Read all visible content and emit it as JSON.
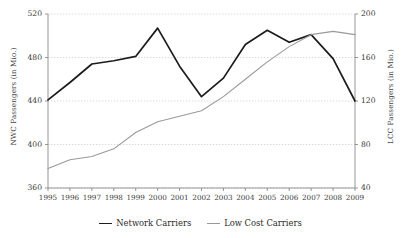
{
  "chart_data": {
    "type": "line",
    "title": "",
    "xlabel": "",
    "categories": [
      "1995",
      "1996",
      "1997",
      "1998",
      "1999",
      "2000",
      "2001",
      "2002",
      "2003",
      "2004",
      "2005",
      "2006",
      "2007",
      "2008",
      "2009"
    ],
    "grid": true,
    "legend_position": "bottom",
    "axes": {
      "left": {
        "label": "NWC Passengers (in Mio.)",
        "ticks": [
          "520",
          "480",
          "440",
          "400",
          "360"
        ],
        "tick_values": [
          520,
          480,
          440,
          400,
          360
        ],
        "range": [
          360,
          520
        ]
      },
      "right": {
        "label": "LCC Passengers (in Mio.)",
        "ticks": [
          "200",
          "160",
          "120",
          "80",
          "40"
        ],
        "tick_values": [
          200,
          160,
          120,
          80,
          40
        ],
        "range": [
          40,
          200
        ]
      }
    },
    "series": [
      {
        "name": "Network Carriers",
        "axis": "left",
        "color": "#1c1c1c",
        "width": 1.7,
        "values": [
          441,
          457,
          474,
          477,
          481,
          507,
          472,
          444,
          461,
          492,
          505,
          494,
          501,
          479,
          440
        ]
      },
      {
        "name": "Low Cost Carriers",
        "axis": "right",
        "color": "#9a9a9a",
        "width": 1.1,
        "values": [
          58,
          66,
          69,
          76,
          91,
          101,
          106,
          111,
          124,
          140,
          156,
          170,
          181,
          184,
          181
        ]
      }
    ]
  },
  "legend": {
    "items": [
      {
        "label": "Network Carriers"
      },
      {
        "label": "Low Cost Carriers"
      }
    ]
  }
}
